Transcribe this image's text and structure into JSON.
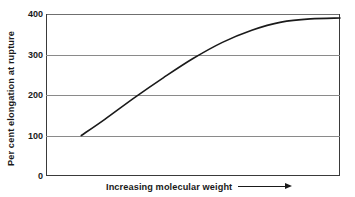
{
  "chart_data": {
    "type": "line",
    "title": "",
    "subtitle": "",
    "xlabel": "Increasing molecular weight",
    "ylabel": "Per cent elongation at rupture",
    "xlim": [
      0,
      100
    ],
    "ylim": [
      0,
      400
    ],
    "y_ticks": [
      400,
      300,
      200,
      100,
      0
    ],
    "y_tick_labels": [
      "400",
      "300",
      "200",
      "100",
      "0"
    ],
    "x_ticks": [],
    "x_tick_labels": [],
    "grid": "horizontal",
    "legend": null,
    "annotations": [
      {
        "name": "x-axis-direction-arrow",
        "text": "Increasing molecular weight",
        "symbol": "→"
      }
    ],
    "series": [
      {
        "name": "Per cent elongation at rupture vs molecular weight",
        "color": "#1a1a1a",
        "x": [
          12,
          20,
          30,
          40,
          50,
          60,
          70,
          80,
          90,
          100
        ],
        "y": [
          100,
          140,
          193,
          243,
          290,
          330,
          360,
          380,
          388,
          390
        ]
      }
    ]
  },
  "axes": {
    "y_label": "Per cent elongation at rupture",
    "x_label": "Increasing molecular weight",
    "arrow_glyph": "→",
    "ticks": [
      {
        "label": "400",
        "value": 400
      },
      {
        "label": "300",
        "value": 300
      },
      {
        "label": "200",
        "value": 200
      },
      {
        "label": "100",
        "value": 100
      },
      {
        "label": "0",
        "value": 0
      }
    ]
  },
  "colors": {
    "curve": "#1a1a1a",
    "gridline": "#8a8a8a",
    "frame": "#3a3a3a",
    "background": "#ffffff",
    "text": "#1a1a1a"
  }
}
